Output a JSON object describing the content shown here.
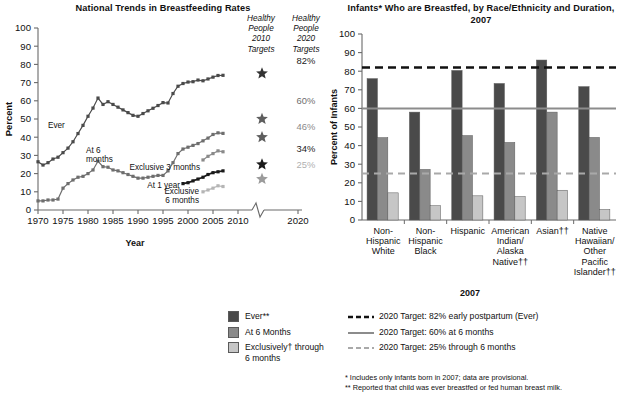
{
  "chart_data": [
    {
      "id": "left",
      "type": "line",
      "title": "National Trends in Breastfeeding Rates",
      "xlabel": "Year",
      "ylabel": "Percent",
      "ylim": [
        0,
        100
      ],
      "ytick_step": 10,
      "yticks": [
        0,
        10,
        20,
        30,
        40,
        50,
        60,
        70,
        80,
        90,
        100
      ],
      "xlim": [
        1970,
        2010
      ],
      "xticks": [
        1970,
        1975,
        1980,
        1985,
        1990,
        1995,
        2000,
        2005,
        2010,
        2020
      ],
      "xaxis_break_between": [
        2010,
        2020
      ],
      "grid": false,
      "series": [
        {
          "name": "Ever",
          "color": "#4a4a4a",
          "label_text": "Ever",
          "x": [
            1970,
            1971,
            1972,
            1973,
            1974,
            1975,
            1976,
            1977,
            1978,
            1979,
            1980,
            1981,
            1982,
            1983,
            1984,
            1985,
            1986,
            1987,
            1988,
            1989,
            1990,
            1991,
            1992,
            1993,
            1994,
            1995,
            1996,
            1997,
            1998,
            1999,
            2000,
            2001,
            2002,
            2003,
            2004,
            2005,
            2006,
            2007
          ],
          "values": [
            26.5,
            24.7,
            26.0,
            28.0,
            29.0,
            31.5,
            34.0,
            37.5,
            42.0,
            46.5,
            51.5,
            56.0,
            61.5,
            58.0,
            59.5,
            58.0,
            56.5,
            55.0,
            53.5,
            52.0,
            51.5,
            53.0,
            54.5,
            55.9,
            57.4,
            59.0,
            58.8,
            64.0,
            68.0,
            69.5,
            70.3,
            70.5,
            71.4,
            71.0,
            72.0,
            73.0,
            73.9,
            74.0
          ]
        },
        {
          "name": "At 6 months",
          "color": "#6e6e6e",
          "label_text": "At 6\nmonths",
          "x": [
            1970,
            1971,
            1972,
            1973,
            1974,
            1975,
            1976,
            1977,
            1978,
            1979,
            1980,
            1981,
            1982,
            1983,
            1984,
            1985,
            1986,
            1987,
            1988,
            1989,
            1990,
            1991,
            1992,
            1993,
            1994,
            1995,
            1996,
            1997,
            1998,
            1999,
            2000,
            2001,
            2002,
            2003,
            2004,
            2005,
            2006,
            2007
          ],
          "values": [
            5.0,
            5.0,
            5.5,
            5.5,
            6.0,
            12.0,
            14.5,
            16.5,
            18.0,
            18.5,
            20.0,
            22.0,
            26.8,
            23.8,
            23.5,
            22.0,
            21.5,
            20.5,
            19.5,
            18.5,
            17.5,
            17.5,
            18.0,
            18.5,
            19.0,
            19.0,
            21.5,
            26.0,
            31.0,
            33.5,
            34.5,
            35.5,
            36.5,
            38.0,
            39.5,
            41.5,
            42.4,
            42.1
          ]
        },
        {
          "name": "At 1 year",
          "color": "#1a1a1a",
          "label_text": "At 1 year",
          "x": [
            1999,
            2000,
            2001,
            2002,
            2003,
            2004,
            2005,
            2006,
            2007
          ],
          "values": [
            14.5,
            15.0,
            16.0,
            17.0,
            18.0,
            19.5,
            20.5,
            21.0,
            21.5
          ]
        },
        {
          "name": "Exclusive 3 months",
          "color": "#8a8a8a",
          "label_text": "Exclusive 3 months",
          "x": [
            2003,
            2004,
            2005,
            2006,
            2007
          ],
          "values": [
            27.5,
            29.5,
            31.0,
            32.5,
            32.0
          ]
        },
        {
          "name": "Exclusive 6 months",
          "color": "#b5b5b5",
          "label_text": "Exclusive\n6 months",
          "x": [
            2003,
            2004,
            2005,
            2006,
            2007
          ],
          "values": [
            10.0,
            11.0,
            12.0,
            13.3,
            12.9
          ]
        }
      ],
      "target_columns": [
        {
          "heading": [
            "Healthy",
            "People",
            "2010",
            "Targets"
          ],
          "marker": "star",
          "entries": [
            {
              "value": 75,
              "color": "#333333",
              "label": ""
            },
            {
              "value": 50,
              "color": "#5e5e5e",
              "label": ""
            },
            {
              "value": 40,
              "color": "#5e5e5e",
              "label": ""
            },
            {
              "value": 25,
              "color": "#1a1a1a",
              "label": ""
            },
            {
              "value": 17,
              "color": "#9b9b9b",
              "label": ""
            }
          ]
        },
        {
          "heading": [
            "Healthy",
            "People",
            "2020",
            "Targets"
          ],
          "marker": "text",
          "entries": [
            {
              "value": 82,
              "color": "#1a1a1a",
              "label": "82%"
            },
            {
              "value": 60,
              "color": "#6e6e6e",
              "label": "60%"
            },
            {
              "value": 46,
              "color": "#8a8a8a",
              "label": "46%"
            },
            {
              "value": 34,
              "color": "#1a1a1a",
              "label": "34%"
            },
            {
              "value": 25,
              "color": "#b0b0b0",
              "label": "25%"
            }
          ]
        }
      ]
    },
    {
      "id": "right",
      "type": "bar",
      "title": "Infants* Who are Breastfed, by Race/Ethnicity and Duration, 2007",
      "xlabel": "2007",
      "ylabel": "Percent of Infants",
      "ylim": [
        0,
        100
      ],
      "yticks": [
        0,
        10,
        20,
        30,
        40,
        50,
        60,
        70,
        80,
        90,
        100
      ],
      "grid": false,
      "categories": [
        "Non-\nHispanic\nWhite",
        "Non-\nHispanic\nBlack",
        "Hispanic",
        "American\nIndian/\nAlaska\nNative††",
        "Asian††",
        "Native\nHawaiian/\nOther\nPacific\nIslander††"
      ],
      "series": [
        {
          "name": "Ever**",
          "color": "#4a4a4a",
          "values": [
            76.0,
            58.0,
            80.4,
            73.4,
            86.0,
            71.7
          ]
        },
        {
          "name": "At 6 Months",
          "color": "#8a8a8a",
          "values": [
            44.3,
            27.2,
            45.4,
            41.7,
            58.0,
            44.4
          ]
        },
        {
          "name": "Exclusively† through 6 months",
          "color": "#c6c6c6",
          "values": [
            14.6,
            7.7,
            13.0,
            12.6,
            16.0,
            5.7
          ]
        }
      ],
      "reference_lines": [
        {
          "value": 82,
          "style": "dashed",
          "color": "#111111",
          "width": 2.4,
          "label": "2020 Target: 82% early postpartum (Ever)"
        },
        {
          "value": 60,
          "style": "solid",
          "color": "#8c8c8c",
          "width": 2.0,
          "label": "2020 Target: 60% at 6 months"
        },
        {
          "value": 25,
          "style": "dashed",
          "color": "#a9a9a9",
          "width": 1.8,
          "label": "2020 Target: 25% through 6 months"
        }
      ]
    }
  ],
  "legend": {
    "swatches": [
      {
        "label": "Ever**",
        "color": "#4a4a4a"
      },
      {
        "label": "At 6 Months",
        "color": "#8a8a8a"
      },
      {
        "label": "Exclusively† through",
        "label2": "6 months",
        "color": "#c6c6c6"
      }
    ],
    "lines": [
      {
        "label": "2020 Target: 82% early postpartum (Ever)",
        "style": "dashed",
        "color": "#111111"
      },
      {
        "label": "2020 Target: 60% at 6 months",
        "style": "solid",
        "color": "#8c8c8c"
      },
      {
        "label": "2020 Target: 25% through 6 months",
        "style": "dashed",
        "color": "#a9a9a9"
      }
    ]
  },
  "footnotes": [
    "* Includes only infants born in 2007; data are provisional.",
    "** Reported that child was ever breastfed or fed human breast milk."
  ]
}
